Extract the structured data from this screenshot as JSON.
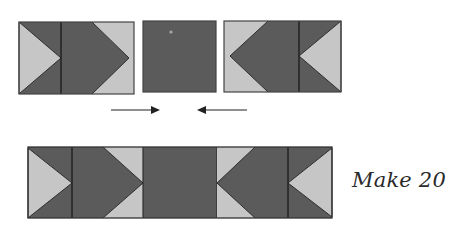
{
  "caption": {
    "text": "Make 20"
  },
  "colors": {
    "dark": "#5b5b5b",
    "light": "#c6c6c6",
    "outline": "#2e2e2e",
    "arrow": "#222222",
    "background": "#ffffff"
  },
  "top_row": {
    "left_unit": {
      "description": "flying geese pair pointing right",
      "x": 19,
      "y": 22,
      "width": 115,
      "height": 72,
      "divider_x": 61,
      "chevron_shoulder_x": 92,
      "chevron_tip_x": 129
    },
    "center_square": {
      "description": "plain dark square",
      "x": 143,
      "y": 21,
      "width": 73,
      "height": 71
    },
    "right_unit": {
      "description": "flying geese pair pointing left",
      "x": 224,
      "y": 21,
      "width": 117,
      "height": 71,
      "divider_x": 299,
      "chevron_shoulder_x": 268,
      "chevron_tip_x": 230
    }
  },
  "arrows": [
    {
      "direction": "right",
      "x1": 111,
      "x2": 160,
      "y": 110
    },
    {
      "direction": "left",
      "x1": 247,
      "x2": 197,
      "y": 110
    }
  ],
  "bottom_row": {
    "description": "assembled strip",
    "x": 28,
    "y": 147,
    "width": 304,
    "height": 71,
    "left_divider_x": 72,
    "left_chevron_shoulder_x": 103,
    "left_chevron_tip_x": 143,
    "center_x1": 143,
    "center_x2": 217,
    "right_chevron_tip_x": 217,
    "right_chevron_shoulder_x": 255,
    "right_divider_x": 288
  }
}
